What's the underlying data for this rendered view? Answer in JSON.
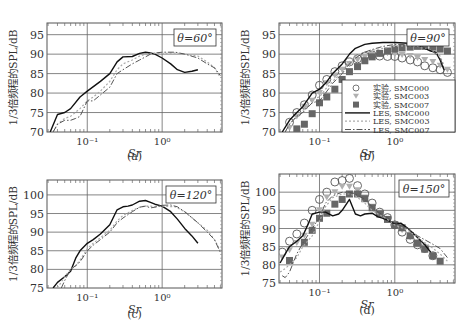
{
  "figure": {
    "ylabel": "1/3倍频程的SPL/dB",
    "xlabel": "Sr",
    "xticks": [
      "10⁻¹",
      "10⁰"
    ]
  },
  "legend": {
    "entries": [
      {
        "label": "实验, SMC000",
        "marker": "circle-open",
        "color": "#555555"
      },
      {
        "label": "实验, SMC003",
        "marker": "triangle-down",
        "color": "#aaaaaa"
      },
      {
        "label": "实验, SMC007",
        "marker": "square-filled",
        "color": "#666666"
      },
      {
        "label": "LES, SMC000",
        "line": "solid",
        "color": "#111111"
      },
      {
        "label": "LES, SMC003",
        "line": "dotted",
        "color": "#aaaaaa"
      },
      {
        "label": "LES, SMC007",
        "line": "dashdot",
        "color": "#555555"
      }
    ]
  },
  "chart_data": [
    {
      "id": "a",
      "type": "line",
      "caption": "(a)",
      "annotation": "θ=60°",
      "xlabel": "Sr",
      "ylabel": "1/3倍频程的SPL/dB",
      "xscale": "log",
      "xlim": [
        0.029,
        6.3
      ],
      "ylim": [
        70,
        98
      ],
      "yticks": [
        70,
        75,
        80,
        85,
        90,
        95
      ],
      "grid": true,
      "series": [
        {
          "name": "LES, SMC000",
          "style": "solid",
          "x": [
            0.032,
            0.04,
            0.05,
            0.06,
            0.08,
            0.1,
            0.15,
            0.2,
            0.25,
            0.3,
            0.4,
            0.5,
            0.6,
            0.7,
            0.8,
            1.0,
            1.3,
            1.6,
            2.0,
            2.5,
            3.0
          ],
          "y": [
            70,
            74.5,
            75,
            76,
            79,
            80.5,
            83,
            85,
            88,
            89.3,
            89.4,
            90.2,
            90.5,
            90.3,
            90.0,
            89.0,
            87.5,
            86,
            85.3,
            85.6,
            86
          ]
        },
        {
          "name": "LES, SMC003",
          "style": "dotted",
          "x": [
            0.035,
            0.04,
            0.05,
            0.06,
            0.08,
            0.1,
            0.12,
            0.15,
            0.2,
            0.25,
            0.3,
            0.4,
            0.5,
            0.6,
            0.7,
            0.8,
            1.0,
            1.5,
            2,
            3,
            4,
            5,
            6
          ],
          "y": [
            70,
            72,
            73.5,
            74,
            76,
            78,
            79,
            80.5,
            83,
            86,
            87.5,
            88.5,
            89.5,
            90,
            90.2,
            90.2,
            90.2,
            90.3,
            90.0,
            89.5,
            88,
            86.5,
            84
          ]
        },
        {
          "name": "LES, SMC007",
          "style": "dashdot",
          "x": [
            0.035,
            0.04,
            0.05,
            0.06,
            0.07,
            0.08,
            0.1,
            0.12,
            0.15,
            0.2,
            0.25,
            0.3,
            0.4,
            0.5,
            0.6,
            0.7,
            0.8,
            1.0,
            1.5,
            2,
            3,
            4,
            5,
            6
          ],
          "y": [
            70,
            72,
            73,
            73,
            73.5,
            74,
            78,
            78,
            79.5,
            81.5,
            85,
            86,
            87.5,
            88.5,
            89.3,
            90,
            90.3,
            90.5,
            90.5,
            90,
            89,
            87.5,
            86.5,
            84.5
          ]
        }
      ]
    },
    {
      "id": "b",
      "type": "line+scatter",
      "caption": "(b)",
      "annotation": "θ=90°",
      "xlabel": "Sr",
      "ylabel": "1/3倍频程的SPL/dB",
      "xscale": "log",
      "xlim": [
        0.029,
        6.3
      ],
      "ylim": [
        70,
        98
      ],
      "yticks": [
        70,
        75,
        80,
        85,
        90,
        95
      ],
      "grid": true,
      "legend_position": "lower right",
      "series": [
        {
          "name": "实验, SMC000",
          "kind": "scatter",
          "marker": "circle-open",
          "x": [
            0.04,
            0.05,
            0.063,
            0.08,
            0.1,
            0.125,
            0.16,
            0.2,
            0.25,
            0.32,
            0.4,
            0.5,
            0.63,
            0.8,
            1.0,
            1.25,
            1.6,
            2.0,
            2.5,
            3.2,
            4.0,
            5.0
          ],
          "y": [
            72.5,
            75,
            77,
            79.5,
            82,
            83.5,
            85.5,
            87,
            88,
            88.8,
            89.5,
            89.8,
            89.5,
            89.4,
            89.4,
            89,
            88.5,
            88,
            87,
            86.5,
            86,
            85.3
          ]
        },
        {
          "name": "实验, SMC003",
          "kind": "scatter",
          "marker": "triangle-down",
          "x": [
            0.04,
            0.05,
            0.063,
            0.08,
            0.1,
            0.125,
            0.16,
            0.2,
            0.25,
            0.32,
            0.4,
            0.5,
            0.63,
            0.8,
            1.0,
            1.25,
            1.6,
            2.0,
            2.5,
            3.2,
            4.0,
            5.0
          ],
          "y": [
            71,
            74,
            76.5,
            78,
            80,
            82.5,
            84.5,
            86,
            87.5,
            88.5,
            89.2,
            89.8,
            90,
            90.2,
            90,
            89.8,
            89.5,
            89,
            88.5,
            88,
            87,
            86
          ]
        },
        {
          "name": "实验, SMC007",
          "kind": "scatter",
          "marker": "square-filled",
          "x": [
            0.05,
            0.063,
            0.08,
            0.1,
            0.125,
            0.16,
            0.2,
            0.25,
            0.32,
            0.4,
            0.5,
            0.63,
            0.8,
            1.0,
            1.25,
            1.6,
            2.0,
            2.5,
            3.2,
            4.0,
            5.0
          ],
          "y": [
            70.8,
            72,
            74.7,
            77.5,
            79,
            81,
            83.5,
            85.5,
            86.8,
            88.3,
            89.3,
            90.2,
            90.8,
            91.3,
            91.6,
            91.8,
            92,
            92,
            91.8,
            91.3,
            90.8
          ]
        },
        {
          "name": "LES, SMC000",
          "kind": "line",
          "style": "solid",
          "x": [
            0.032,
            0.04,
            0.05,
            0.06,
            0.08,
            0.1,
            0.12,
            0.15,
            0.2,
            0.25,
            0.3,
            0.4,
            0.5,
            0.7,
            1.0,
            1.5,
            2.0,
            2.5,
            3.0,
            3.5,
            4.0,
            4.5
          ],
          "y": [
            70,
            73,
            75,
            76.5,
            80,
            81,
            82.5,
            85,
            87.5,
            90,
            91.5,
            92.5,
            92.8,
            93,
            93,
            92.8,
            92.5,
            91.5,
            90.8,
            90.5,
            88.5,
            86
          ]
        },
        {
          "name": "LES, SMC003",
          "kind": "line",
          "style": "dotted",
          "x": [
            0.035,
            0.04,
            0.05,
            0.06,
            0.08,
            0.1,
            0.12,
            0.15,
            0.2,
            0.25,
            0.3,
            0.4,
            0.5,
            0.7,
            1.0,
            1.5,
            2.0,
            3.0,
            4.0,
            4.5
          ],
          "y": [
            70,
            72,
            74,
            75.5,
            78.5,
            79,
            81,
            83,
            85.5,
            88,
            89.5,
            90.5,
            91,
            91.5,
            92,
            92.2,
            92,
            91.2,
            89.5,
            87
          ]
        },
        {
          "name": "LES, SMC007",
          "kind": "line",
          "style": "dashdot",
          "x": [
            0.035,
            0.04,
            0.05,
            0.06,
            0.08,
            0.1,
            0.12,
            0.15,
            0.2,
            0.25,
            0.3,
            0.4,
            0.5,
            0.7,
            1.0,
            1.5,
            2.0,
            3.0,
            4.0,
            4.5
          ],
          "y": [
            70,
            72,
            74,
            75,
            77.5,
            78,
            80,
            82.5,
            85,
            87.5,
            89,
            90.5,
            91.2,
            92,
            92.5,
            92.5,
            92.2,
            91.2,
            89,
            86.5
          ]
        }
      ]
    },
    {
      "id": "c",
      "type": "line",
      "caption": "(c)",
      "annotation": "θ=120°",
      "xlabel": "Sr",
      "ylabel": "1/3倍频程的SPL/dB",
      "xscale": "log",
      "xlim": [
        0.029,
        6.3
      ],
      "ylim": [
        75,
        104
      ],
      "yticks": [
        75,
        80,
        85,
        90,
        95,
        100
      ],
      "grid": true,
      "series": [
        {
          "name": "LES, SMC000",
          "style": "solid",
          "x": [
            0.035,
            0.04,
            0.05,
            0.06,
            0.07,
            0.08,
            0.1,
            0.12,
            0.15,
            0.2,
            0.25,
            0.3,
            0.35,
            0.4,
            0.5,
            0.6,
            0.7,
            0.8,
            1.0,
            1.3,
            1.6,
            2.0,
            2.5,
            3.0
          ],
          "y": [
            75,
            76.5,
            78,
            79.5,
            83,
            85,
            87,
            88,
            89.5,
            92,
            96,
            96.8,
            97,
            97.3,
            98.3,
            98.5,
            98,
            97.5,
            97,
            95.5,
            93.5,
            91,
            89,
            87
          ]
        },
        {
          "name": "LES, SMC003",
          "style": "dotted",
          "x": [
            0.04,
            0.05,
            0.06,
            0.07,
            0.08,
            0.1,
            0.12,
            0.15,
            0.2,
            0.25,
            0.3,
            0.4,
            0.5,
            0.6,
            0.7,
            0.8,
            1.0,
            1.5,
            2,
            3,
            4,
            5,
            6
          ],
          "y": [
            75,
            78,
            80,
            81,
            82.5,
            85.5,
            87,
            88.5,
            90.5,
            93,
            94.5,
            95.8,
            96.7,
            97,
            97,
            96.8,
            97,
            96.8,
            95.5,
            92.5,
            90.5,
            88,
            85
          ]
        },
        {
          "name": "LES, SMC007",
          "style": "dashdot",
          "x": [
            0.045,
            0.05,
            0.06,
            0.07,
            0.08,
            0.1,
            0.12,
            0.15,
            0.2,
            0.25,
            0.3,
            0.4,
            0.5,
            0.6,
            0.7,
            0.8,
            1.0,
            1.3,
            1.6,
            2,
            3,
            4,
            5,
            6
          ],
          "y": [
            75,
            77,
            80,
            81,
            82,
            85,
            86.5,
            88,
            90,
            92.5,
            93.8,
            95.5,
            96.7,
            97,
            96.5,
            96.7,
            97.2,
            97.3,
            96.8,
            95.5,
            92.5,
            90,
            88,
            84.5
          ]
        }
      ]
    },
    {
      "id": "d",
      "type": "line+scatter",
      "caption": "(d)",
      "annotation": "θ=150°",
      "xlabel": "Sr",
      "ylabel": "1/3倍频程的SPL/dB",
      "xscale": "log",
      "xlim": [
        0.029,
        6.3
      ],
      "ylim": [
        75,
        105
      ],
      "yticks": [
        75,
        80,
        85,
        90,
        95,
        100
      ],
      "grid": true,
      "series": [
        {
          "name": "实验, SMC000",
          "kind": "scatter",
          "marker": "circle-open",
          "x": [
            0.032,
            0.04,
            0.05,
            0.063,
            0.08,
            0.1,
            0.125,
            0.16,
            0.2,
            0.25,
            0.32,
            0.4,
            0.5,
            0.63,
            0.8,
            1.0,
            1.25,
            1.6,
            2.0,
            2.5,
            3.2
          ],
          "y": [
            83.5,
            86.5,
            88.5,
            91.5,
            95,
            98,
            100,
            102.8,
            103.2,
            103.8,
            101.8,
            99.5,
            97,
            94.5,
            93,
            91,
            89,
            87,
            85.5,
            84.5,
            82.5
          ]
        },
        {
          "name": "实验, SMC003",
          "kind": "scatter",
          "marker": "triangle-down",
          "x": [
            0.032,
            0.04,
            0.05,
            0.063,
            0.08,
            0.1,
            0.125,
            0.16,
            0.2,
            0.25,
            0.32,
            0.4,
            0.5,
            0.63,
            0.8,
            1.0,
            1.25,
            1.6,
            2.0,
            2.5,
            3.2
          ],
          "y": [
            82,
            84,
            86,
            88,
            91,
            95,
            98.5,
            100,
            101.5,
            101.5,
            100.5,
            98.5,
            96,
            94,
            92.5,
            91,
            89.5,
            87.5,
            86,
            84.5,
            82.5
          ]
        },
        {
          "name": "实验, SMC007",
          "kind": "scatter",
          "marker": "square-filled",
          "x": [
            0.04,
            0.063,
            0.08,
            0.1,
            0.125,
            0.16,
            0.2,
            0.25,
            0.32,
            0.4,
            0.5,
            0.63,
            0.8,
            1.0,
            1.25,
            1.6,
            2.0,
            2.5,
            3.2,
            4.0
          ],
          "y": [
            81.2,
            86.2,
            89.5,
            92.8,
            94.2,
            96.7,
            98,
            99.5,
            99.5,
            98.2,
            95.7,
            94,
            92.5,
            91,
            90.2,
            88,
            86,
            84.3,
            82.5,
            81
          ]
        },
        {
          "name": "LES, SMC000",
          "kind": "line",
          "style": "solid",
          "x": [
            0.03,
            0.035,
            0.04,
            0.05,
            0.06,
            0.07,
            0.08,
            0.1,
            0.12,
            0.15,
            0.18,
            0.2,
            0.25,
            0.3,
            0.35,
            0.4,
            0.5,
            0.6,
            0.7,
            0.8,
            1.0,
            1.2,
            1.5,
            2.0,
            2.5,
            3.0
          ],
          "y": [
            80.5,
            83,
            85,
            86.5,
            88,
            91,
            94,
            94.5,
            94.5,
            93.5,
            94,
            95,
            98,
            94,
            93.5,
            94,
            94.2,
            93.2,
            92.8,
            92.3,
            91.3,
            91.5,
            90,
            87.5,
            85.5,
            83.5
          ]
        },
        {
          "name": "LES, SMC003",
          "kind": "line",
          "style": "dotted",
          "x": [
            0.03,
            0.035,
            0.04,
            0.05,
            0.06,
            0.08,
            0.1,
            0.12,
            0.15,
            0.2,
            0.25,
            0.3,
            0.4,
            0.5,
            0.6,
            0.8,
            1.0,
            1.5,
            2.0,
            3.0,
            4.0,
            5.0
          ],
          "y": [
            78,
            79,
            80,
            82,
            85,
            88,
            92,
            96,
            98.5,
            99.5,
            99.5,
            99,
            97,
            95,
            94,
            92.5,
            91,
            89.5,
            87.5,
            85,
            83,
            81
          ]
        },
        {
          "name": "LES, SMC007",
          "kind": "line",
          "style": "dashdot",
          "x": [
            0.032,
            0.035,
            0.04,
            0.05,
            0.06,
            0.08,
            0.1,
            0.12,
            0.15,
            0.2,
            0.25,
            0.3,
            0.4,
            0.5,
            0.6,
            0.8,
            1.0,
            1.5,
            2.0,
            3.0,
            4.0,
            5.0
          ],
          "y": [
            77,
            76.5,
            78,
            83,
            86,
            90,
            93,
            97,
            99,
            100,
            100,
            99.5,
            98,
            96,
            94.5,
            93,
            91.5,
            90,
            88,
            86,
            84.5,
            82
          ]
        }
      ]
    }
  ]
}
